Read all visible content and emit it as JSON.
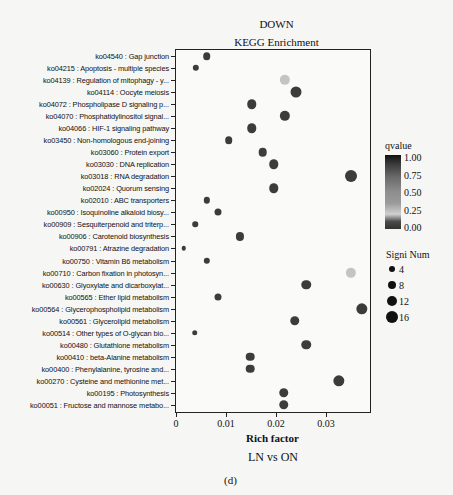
{
  "chart_data": {
    "type": "scatter",
    "title": "DOWN",
    "subtitle": "KEGG Enrichment",
    "xlabel": "Rich factor",
    "ylabel": "",
    "comparison": "LN vs ON",
    "caption": "(d)",
    "xlim": [
      0,
      0.039
    ],
    "xticks": [
      "0",
      "0.01",
      "0.02",
      "0.03"
    ],
    "grid": false,
    "legend_position": "right",
    "legend_color_title": "qvalue",
    "legend_color_ticks": [
      "1.00",
      "0.75",
      "0.50",
      "0.25",
      "0.00"
    ],
    "legend_size_title": "Signi Num",
    "legend_size_ticks": [
      "4",
      "8",
      "12",
      "16"
    ],
    "categories": [
      "ko04540 : Gap junction",
      "ko04215 : Apoptosis - multiple species",
      "ko04139 : Regulation of mitophagy - y...",
      "ko04114 : Oocyte meiosis",
      "ko04072 : Phospholipase D signaling p...",
      "ko04070 : Phosphatidylinositol signal...",
      "ko04066 : HIF-1 signaling pathway",
      "ko03450 : Non-homologous end-joining",
      "ko03060 : Protein export",
      "ko03030 : DNA replication",
      "ko03018 : RNA degradation",
      "ko02024 : Quorum sensing",
      "ko02010 : ABC transporters",
      "ko00950 : Isoquinoline alkaloid biosy...",
      "ko00909 : Sesquiterpenoid and triterp...",
      "ko00906 : Carotenoid biosynthesis",
      "ko00791 : Atrazine degradation",
      "ko00750 : Vitamin B6 metabolism",
      "ko00710 : Carbon fixation in photosyn...",
      "ko00630 : Glyoxylate and dicarboxylat...",
      "ko00565 : Ether lipid metabolism",
      "ko00564 : Glycerophospholipid metabolism",
      "ko00561 : Glycerolipid metabolism",
      "ko00514 : Other types of O-glycan bio...",
      "ko00480 : Glutathione metabolism",
      "ko00410 : beta-Alanine metabolism",
      "ko00400 : Phenylalanine, tyrosine and...",
      "ko00270 : Cysteine and methionine met...",
      "ko00195 : Photosynthesis",
      "ko00051 : Fructose and mannose metabo..."
    ],
    "rich_factor": [
      0.0061,
      0.004,
      0.0218,
      0.0239,
      0.0151,
      0.0218,
      0.0151,
      0.0105,
      0.0173,
      0.0195,
      0.0349,
      0.0195,
      0.0061,
      0.0083,
      0.0038,
      0.0127,
      0.0015,
      0.0061,
      0.0349,
      0.026,
      0.0083,
      0.0371,
      0.0237,
      0.0037,
      0.026,
      0.0148,
      0.0148,
      0.0326,
      0.0215,
      0.0215
    ],
    "signi_num": [
      5,
      3,
      11,
      13,
      9,
      11,
      9,
      5,
      7,
      9,
      16,
      9,
      3,
      4,
      2,
      6,
      1,
      3,
      11,
      9,
      4,
      14,
      9,
      2,
      9,
      7,
      7,
      14,
      9,
      9
    ],
    "qvalue": [
      0.15,
      0.15,
      0.7,
      0.1,
      0.1,
      0.1,
      0.1,
      0.15,
      0.1,
      0.1,
      0.1,
      0.1,
      0.15,
      0.15,
      0.15,
      0.15,
      0.15,
      0.15,
      0.7,
      0.1,
      0.15,
      0.1,
      0.1,
      0.15,
      0.1,
      0.1,
      0.1,
      0.1,
      0.1,
      0.1
    ]
  },
  "colors": {
    "dot_dark": "#3c3c3c",
    "dot_light": "#c4c4c4",
    "axis": "#222222",
    "background": "#f6f6f4"
  }
}
